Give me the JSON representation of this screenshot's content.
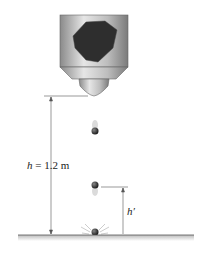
{
  "diagram": {
    "labels": {
      "height_var": "h",
      "height_eq": " = 1.2 m",
      "rebound_var": "h′"
    },
    "parts": [
      "hopper",
      "dropping-ball",
      "falling-ball",
      "bouncing-ball",
      "ground",
      "height-dimension",
      "rebound-dimension"
    ],
    "colors": {
      "ball": "#2a2a2a",
      "hopper": "#b8b8b8",
      "line": "#555555"
    }
  }
}
